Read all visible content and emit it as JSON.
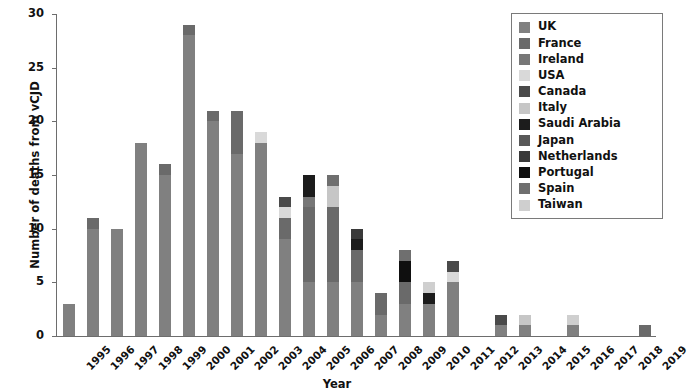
{
  "chart_data": {
    "type": "bar",
    "stacked": true,
    "title": "",
    "xlabel": "Year",
    "ylabel": "Number of deaths from vCJD",
    "ylim": [
      0,
      30
    ],
    "yticks": [
      0,
      5,
      10,
      15,
      20,
      25,
      30
    ],
    "grid": false,
    "legend_position": "top-right",
    "categories": [
      "1995",
      "1996",
      "1997",
      "1998",
      "1999",
      "2000",
      "2001",
      "2002",
      "2003",
      "2004",
      "2005",
      "2006",
      "2007",
      "2008",
      "2009",
      "2010",
      "2011",
      "2012",
      "2013",
      "2014",
      "2015",
      "2016",
      "2017",
      "2018",
      "2019"
    ],
    "series": [
      {
        "name": "UK",
        "color": "#808080",
        "values": [
          3,
          10,
          10,
          18,
          15,
          28,
          20,
          17,
          18,
          9,
          5,
          5,
          5,
          2,
          3,
          3,
          5,
          0,
          1,
          1,
          0,
          1,
          0,
          0,
          0
        ]
      },
      {
        "name": "France",
        "color": "#6a6a6a",
        "values": [
          0,
          1,
          0,
          0,
          1,
          1,
          1,
          4,
          0,
          2,
          7,
          7,
          3,
          2,
          2,
          0,
          0,
          0,
          0,
          0,
          0,
          0,
          0,
          0,
          1
        ]
      },
      {
        "name": "Ireland",
        "color": "#777777",
        "values": [
          0,
          0,
          0,
          0,
          0,
          0,
          0,
          0,
          0,
          0,
          1,
          0,
          0,
          0,
          0,
          0,
          0,
          0,
          0,
          0,
          0,
          0,
          0,
          0,
          0
        ]
      },
      {
        "name": "USA",
        "color": "#d9d9d9",
        "values": [
          0,
          0,
          0,
          0,
          0,
          0,
          0,
          0,
          1,
          1,
          0,
          0,
          0,
          0,
          0,
          0,
          1,
          0,
          0,
          0,
          0,
          0,
          0,
          0,
          0
        ]
      },
      {
        "name": "Canada",
        "color": "#4a4a4a",
        "values": [
          0,
          0,
          0,
          0,
          0,
          0,
          0,
          0,
          0,
          1,
          0,
          0,
          0,
          0,
          0,
          0,
          1,
          0,
          1,
          0,
          0,
          0,
          0,
          0,
          0
        ]
      },
      {
        "name": "Italy",
        "color": "#c6c6c6",
        "values": [
          0,
          0,
          0,
          0,
          0,
          0,
          0,
          0,
          0,
          0,
          0,
          2,
          0,
          0,
          0,
          0,
          0,
          0,
          0,
          1,
          0,
          0,
          0,
          0,
          0
        ]
      },
      {
        "name": "Saudi Arabia",
        "color": "#1c1c1c",
        "values": [
          0,
          0,
          0,
          0,
          0,
          0,
          0,
          0,
          0,
          0,
          2,
          0,
          1,
          0,
          0,
          1,
          0,
          0,
          0,
          0,
          0,
          0,
          0,
          0,
          0
        ]
      },
      {
        "name": "Japan",
        "color": "#585858",
        "values": [
          0,
          0,
          0,
          0,
          0,
          0,
          0,
          0,
          0,
          0,
          0,
          0,
          0,
          0,
          0,
          0,
          0,
          0,
          0,
          0,
          0,
          0,
          0,
          0,
          0
        ]
      },
      {
        "name": "Netherlands",
        "color": "#3a3a3a",
        "values": [
          0,
          0,
          0,
          0,
          0,
          0,
          0,
          0,
          0,
          0,
          0,
          0,
          1,
          0,
          0,
          0,
          0,
          0,
          0,
          0,
          0,
          0,
          0,
          0,
          0
        ]
      },
      {
        "name": "Portugal",
        "color": "#0f0f0f",
        "values": [
          0,
          0,
          0,
          0,
          0,
          0,
          0,
          0,
          0,
          0,
          0,
          0,
          0,
          0,
          2,
          0,
          0,
          0,
          0,
          0,
          0,
          0,
          0,
          0,
          0
        ]
      },
      {
        "name": "Spain",
        "color": "#6f6f6f",
        "values": [
          0,
          0,
          0,
          0,
          0,
          0,
          0,
          0,
          0,
          0,
          0,
          1,
          0,
          0,
          1,
          0,
          0,
          0,
          0,
          0,
          0,
          0,
          0,
          0,
          0
        ]
      },
      {
        "name": "Taiwan",
        "color": "#cfcfcf",
        "values": [
          0,
          0,
          0,
          0,
          0,
          0,
          0,
          0,
          0,
          0,
          0,
          0,
          0,
          0,
          0,
          1,
          0,
          0,
          0,
          0,
          0,
          1,
          0,
          0,
          0
        ]
      }
    ],
    "totals": [
      3,
      11,
      10,
      18,
      16,
      29,
      21,
      21,
      19,
      13,
      15,
      15,
      10,
      4,
      8,
      5,
      7,
      0,
      2,
      2,
      0,
      2,
      0,
      0,
      1
    ]
  },
  "axes": {
    "y_title": "Number of deaths from vCJD",
    "x_title": "Year"
  }
}
